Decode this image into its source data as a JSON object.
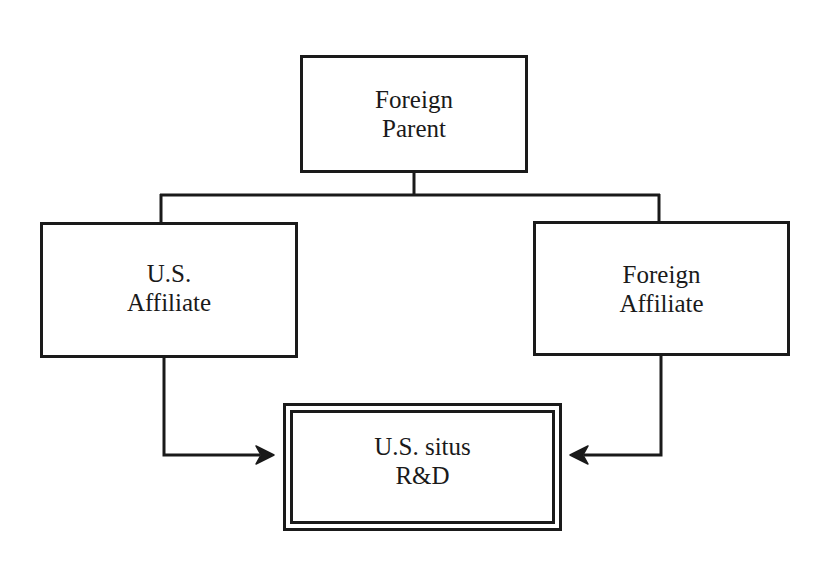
{
  "diagram": {
    "type": "organizational-flow",
    "nodes": {
      "foreign_parent": {
        "line1": "Foreign",
        "line2": "Parent"
      },
      "us_affiliate": {
        "line1": "U.S.",
        "line2": "Affiliate"
      },
      "foreign_affiliate": {
        "line1": "Foreign",
        "line2": "Affiliate"
      },
      "us_situs_rd": {
        "line1": "U.S. situs",
        "line2": "R&D",
        "style": "double-border"
      }
    },
    "edges": [
      {
        "from": "foreign_parent",
        "to": "us_affiliate",
        "type": "line"
      },
      {
        "from": "foreign_parent",
        "to": "foreign_affiliate",
        "type": "line"
      },
      {
        "from": "us_affiliate",
        "to": "us_situs_rd",
        "type": "arrow"
      },
      {
        "from": "foreign_affiliate",
        "to": "us_situs_rd",
        "type": "arrow"
      }
    ],
    "colors": {
      "stroke": "#1a1a1a",
      "background": "#ffffff"
    }
  }
}
